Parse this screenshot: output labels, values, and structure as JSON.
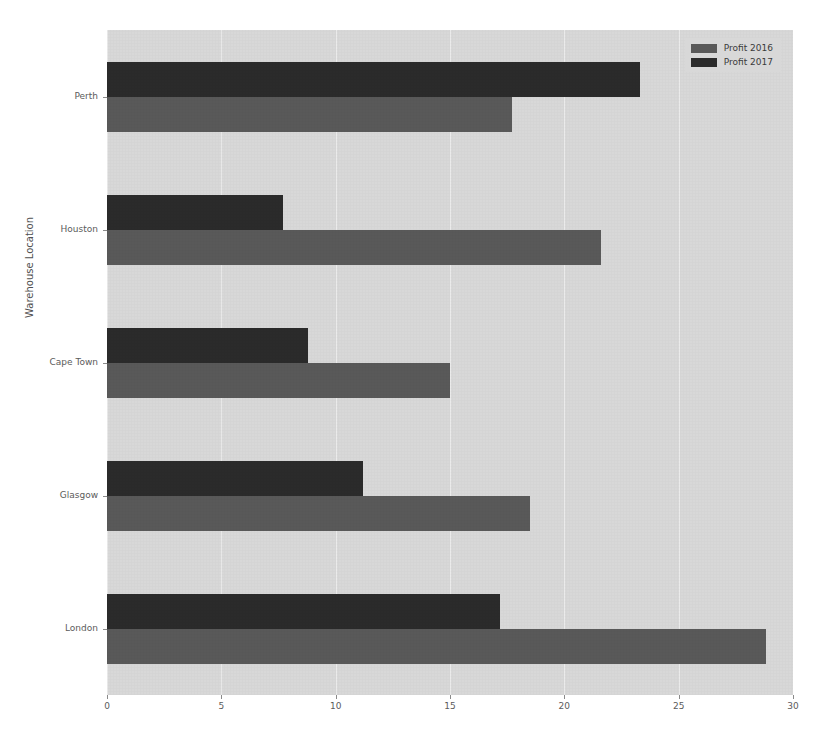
{
  "chart_data": {
    "type": "bar",
    "orientation": "horizontal",
    "title": "",
    "xlabel": "",
    "ylabel": "Warehouse Location",
    "categories": [
      "London",
      "Glasgow",
      "Cape Town",
      "Houston",
      "Perth"
    ],
    "series": [
      {
        "name": "Profit 2016",
        "color": "#595959",
        "values": [
          28.8,
          18.5,
          15.0,
          21.6,
          17.7
        ]
      },
      {
        "name": "Profit 2017",
        "color": "#2b2b2b",
        "values": [
          17.2,
          11.2,
          8.8,
          7.7,
          23.3
        ]
      }
    ],
    "xlim": [
      0,
      30
    ],
    "xticks": [
      0,
      5,
      10,
      15,
      20,
      25,
      30
    ],
    "xticklabels": [
      "0",
      "5",
      "10",
      "15",
      "20",
      "25",
      "30"
    ],
    "yticklabels": [
      "London",
      "Glasgow",
      "Cape Town",
      "Houston",
      "Perth"
    ],
    "grid": true,
    "grid_axis": "x",
    "legend_position": "upper right",
    "plot_background": "#d8d8d8",
    "figure_background": "#ffffff",
    "gridline_color": "#efefef",
    "tick_label_color": "#5b5b5b"
  },
  "legend": {
    "entries": [
      {
        "label": "Profit 2016"
      },
      {
        "label": "Profit 2017"
      }
    ]
  },
  "axes": {
    "y_title": "Warehouse Location"
  }
}
